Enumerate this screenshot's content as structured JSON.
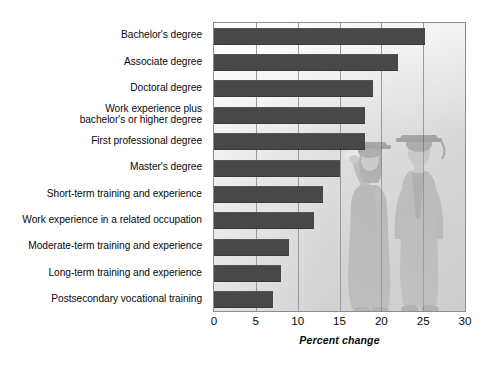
{
  "chart_data": {
    "type": "bar",
    "orientation": "horizontal",
    "title": "",
    "subtitle": "",
    "xlabel": "Percent change",
    "ylabel": "",
    "xlim": [
      0,
      30
    ],
    "xticks": [
      0,
      5,
      10,
      15,
      20,
      25,
      30
    ],
    "xtick_labels": [
      "0",
      "5",
      "10",
      "15",
      "20",
      "25",
      "30"
    ],
    "grid": true,
    "grid_axis": "x",
    "legend": null,
    "legend_position": "none",
    "bar_color": "#484848",
    "plot_border_color": "#8d8d8d",
    "categories": [
      "Bachelor's degree",
      "Associate degree",
      "Doctoral degree",
      "Work experience plus bachelor's or higher degree",
      "First professional degree",
      "Master's degree",
      "Short-term training and experience",
      "Work experience in a related occupation",
      "Moderate-term training and experience",
      "Long-term training and experience",
      "Postsecondary vocational training"
    ],
    "category_lines": [
      [
        "Bachelor's degree"
      ],
      [
        "Associate degree"
      ],
      [
        "Doctoral degree"
      ],
      [
        "Work experience plus",
        "bachelor's or higher degree"
      ],
      [
        "First professional degree"
      ],
      [
        "Master's degree"
      ],
      [
        "Short-term training and experience"
      ],
      [
        "Work experience in a related occupation"
      ],
      [
        "Moderate-term training and experience"
      ],
      [
        "Long-term training and experience"
      ],
      [
        "Postsecondary vocational training"
      ]
    ],
    "values": [
      25.2,
      22.0,
      19.0,
      18.0,
      18.0,
      15.0,
      13.0,
      12.0,
      9.0,
      8.0,
      7.0
    ],
    "annotations": [
      {
        "name": "graduates-illustration",
        "description": "Faded watermark illustration of two graduates in caps and gowns holding a diploma"
      }
    ]
  }
}
